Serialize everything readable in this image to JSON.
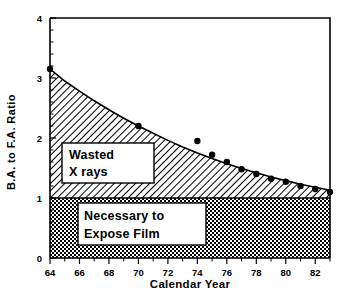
{
  "chart_data": {
    "type": "area",
    "title": "",
    "xlabel": "Calendar Year",
    "ylabel": "B.A. to F.A. Ratio",
    "xlim": [
      64,
      83
    ],
    "ylim": [
      0,
      4
    ],
    "xticks": [
      "64",
      "66",
      "68",
      "70",
      "72",
      "74",
      "76",
      "78",
      "80",
      "82"
    ],
    "xtick_values": [
      64,
      66,
      68,
      70,
      72,
      74,
      76,
      78,
      80,
      82
    ],
    "yticks": [
      "0",
      "1",
      "2",
      "3",
      "4"
    ],
    "ytick_values": [
      0,
      1,
      2,
      3,
      4
    ],
    "grid": false,
    "legend": "none",
    "series": [
      {
        "name": "B.A. to F.A. Ratio curve",
        "type": "line",
        "x": [
          64,
          65,
          66,
          67,
          68,
          69,
          70,
          71,
          72,
          73,
          74,
          75,
          76,
          77,
          78,
          79,
          80,
          81,
          82,
          83
        ],
        "values": [
          3.15,
          2.95,
          2.78,
          2.62,
          2.47,
          2.33,
          2.2,
          2.08,
          1.96,
          1.85,
          1.75,
          1.66,
          1.57,
          1.49,
          1.42,
          1.35,
          1.29,
          1.23,
          1.18,
          1.13
        ]
      },
      {
        "name": "Measured data points",
        "type": "scatter",
        "x": [
          64,
          70,
          74,
          75,
          76,
          77,
          78,
          79,
          80,
          81,
          82,
          83
        ],
        "values": [
          3.15,
          2.2,
          1.95,
          1.72,
          1.6,
          1.48,
          1.4,
          1.32,
          1.27,
          1.2,
          1.15,
          1.1
        ]
      }
    ],
    "regions": [
      {
        "name": "wasted-x-rays",
        "label": "Wasted\nX rays",
        "label_line1": "Wasted",
        "label_line2": "X rays",
        "y_from": 1,
        "y_to": "curve",
        "fill": "diagonal-hatch"
      },
      {
        "name": "necessary-to-expose-film",
        "label": "Necessary to\nExpose Film",
        "label_line1": "Necessary to",
        "label_line2": "Expose Film",
        "y_from": 0,
        "y_to": 1,
        "fill": "crosshatch-dots"
      }
    ],
    "colors": {
      "axis": "#000000",
      "curve": "#000000",
      "point": "#000000",
      "background": "#ffffff"
    }
  }
}
